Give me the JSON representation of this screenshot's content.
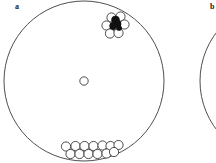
{
  "figure": {
    "type": "scatter",
    "width": 216,
    "height": 163,
    "background": "#ffffff",
    "panels": [
      {
        "id": "a",
        "label": "a",
        "label_x": 15,
        "label_y": 3,
        "arena": {
          "shape": "circle",
          "cx": 84,
          "cy": 81,
          "r": 80,
          "stroke": "#3a3a3a",
          "stroke_width": 0.9,
          "fill": "none"
        },
        "center_marker": {
          "cx": 84,
          "cy": 81,
          "r": 4.2,
          "stroke": "#3a3a3a",
          "fill": "#ffffff"
        },
        "clusters": [
          {
            "name": "upper-right-cluster",
            "open_markers": [
              {
                "cx": 111.5,
                "cy": 17.5,
                "r": 4.6
              },
              {
                "cx": 120.5,
                "cy": 16.5,
                "r": 4.6
              },
              {
                "cx": 106.5,
                "cy": 25.5,
                "r": 4.6
              },
              {
                "cx": 115.0,
                "cy": 25.0,
                "r": 4.6
              },
              {
                "cx": 124.5,
                "cy": 24.5,
                "r": 4.6
              },
              {
                "cx": 110.0,
                "cy": 33.5,
                "r": 4.6
              },
              {
                "cx": 118.5,
                "cy": 33.0,
                "r": 4.6
              }
            ],
            "filled_markers": [
              {
                "cx": 115.5,
                "cy": 20.0,
                "r": 4.0
              },
              {
                "cx": 117.5,
                "cy": 24.0,
                "r": 3.6
              },
              {
                "cx": 113.0,
                "cy": 26.0,
                "r": 3.4
              },
              {
                "cx": 119.0,
                "cy": 28.0,
                "r": 2.6
              }
            ],
            "fill_color": "#111111"
          },
          {
            "name": "bottom-cluster",
            "open_markers": [
              {
                "cx": 66.0,
                "cy": 146.5,
                "r": 4.6
              },
              {
                "cx": 75.5,
                "cy": 146.0,
                "r": 4.6
              },
              {
                "cx": 84.5,
                "cy": 146.0,
                "r": 4.6
              },
              {
                "cx": 93.5,
                "cy": 146.0,
                "r": 4.6
              },
              {
                "cx": 102.5,
                "cy": 145.5,
                "r": 4.6
              },
              {
                "cx": 110.5,
                "cy": 146.0,
                "r": 4.6
              },
              {
                "cx": 118.5,
                "cy": 145.0,
                "r": 4.6
              },
              {
                "cx": 70.5,
                "cy": 154.0,
                "r": 4.6
              },
              {
                "cx": 79.5,
                "cy": 154.0,
                "r": 4.6
              },
              {
                "cx": 88.5,
                "cy": 154.0,
                "r": 4.6
              },
              {
                "cx": 97.5,
                "cy": 154.0,
                "r": 4.6
              },
              {
                "cx": 106.5,
                "cy": 153.5,
                "r": 4.6
              },
              {
                "cx": 114.0,
                "cy": 152.0,
                "r": 4.6
              }
            ],
            "filled_markers": [],
            "fill_color": "#111111"
          }
        ]
      },
      {
        "id": "b",
        "label": "b",
        "label_x": 210,
        "label_y": 3,
        "arena": {
          "shape": "circle",
          "cx": 280,
          "cy": 81,
          "r": 80,
          "stroke": "#3a3a3a",
          "stroke_width": 0.9,
          "fill": "none"
        },
        "center_marker": null,
        "clusters": []
      }
    ],
    "marker_style": {
      "open_stroke": "#3a3a3a",
      "open_fill": "#ffffff",
      "open_stroke_width": 0.9,
      "filled_fill": "#111111"
    }
  }
}
